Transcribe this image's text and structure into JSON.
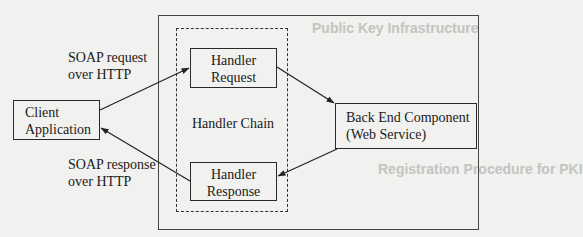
{
  "diagram": {
    "nodes": {
      "client": {
        "line1": "Client",
        "line2": "Application"
      },
      "handler_request": {
        "line1": "Handler",
        "line2": "Request"
      },
      "handler_response": {
        "line1": "Handler",
        "line2": "Response"
      },
      "backend": {
        "line1": "Back End Component",
        "line2": "(Web Service)"
      }
    },
    "groups": {
      "handler_chain": {
        "label": "Handler Chain",
        "style": "dashed"
      },
      "server_container": {
        "style": "solid"
      }
    },
    "edges": [
      {
        "from": "client",
        "to": "handler_request",
        "label_line1": "SOAP request",
        "label_line2": "over HTTP"
      },
      {
        "from": "handler_request",
        "to": "backend"
      },
      {
        "from": "backend",
        "to": "handler_response"
      },
      {
        "from": "handler_response",
        "to": "client",
        "label_line1": "SOAP response",
        "label_line2": "over HTTP"
      }
    ],
    "labels": {
      "request": {
        "line1": "SOAP request",
        "line2": "over HTTP"
      },
      "response": {
        "line1": "SOAP response",
        "line2": "over HTTP"
      }
    }
  },
  "bleed_through": {
    "heading1": "Public Key Infrastructure",
    "heading2": "Registration Procedure for PKI"
  },
  "colors": {
    "background": "#f1f1ef",
    "ink": "#1a1a1a"
  }
}
